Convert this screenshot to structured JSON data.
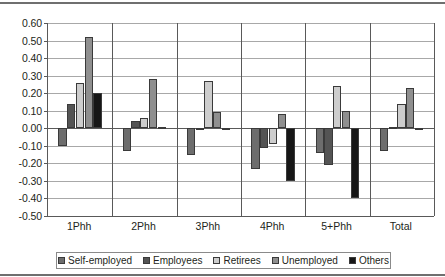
{
  "chart_data": {
    "type": "bar",
    "title": "",
    "subtitle": "",
    "xlabel": "",
    "ylabel": "",
    "ylim": [
      -0.5,
      0.6
    ],
    "ytick_step": 0.1,
    "yticks": [
      "0.60",
      "0.50",
      "0.40",
      "0.30",
      "0.20",
      "0.10",
      "0.00",
      "-0.10",
      "-0.20",
      "-0.30",
      "-0.40",
      "-0.50"
    ],
    "grid": true,
    "legend_position": "bottom",
    "categories": [
      "1Phh",
      "2Phh",
      "3Phh",
      "4Phh",
      "5+Phh",
      "Total"
    ],
    "series": [
      {
        "name": "Self-employed",
        "color": "#6d6d6d",
        "values": [
          -0.1,
          -0.13,
          -0.15,
          -0.23,
          -0.14,
          -0.13
        ]
      },
      {
        "name": "Employees",
        "color": "#545454",
        "values": [
          0.14,
          0.04,
          0.0,
          -0.11,
          -0.21,
          0.01
        ]
      },
      {
        "name": "Retirees",
        "color": "#cdcdcd",
        "values": [
          0.26,
          0.06,
          0.27,
          -0.09,
          0.24,
          0.14
        ]
      },
      {
        "name": "Unemployed",
        "color": "#8f8f8f",
        "values": [
          0.52,
          0.28,
          0.09,
          0.08,
          0.1,
          0.23
        ]
      },
      {
        "name": "Others",
        "color": "#171717",
        "values": [
          0.2,
          0.01,
          0.0,
          -0.3,
          -0.4,
          -0.01
        ]
      }
    ]
  }
}
